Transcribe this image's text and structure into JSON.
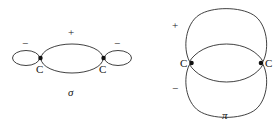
{
  "figure": {
    "background_color": "#ffffff",
    "stroke_color": "#2b2b2b",
    "atom_dot_color": "#111111"
  },
  "sigma_diagram": {
    "name_label": "σ",
    "atoms": [
      {
        "label": "C",
        "x": 40,
        "y": 58
      },
      {
        "label": "C",
        "x": 104,
        "y": 58
      }
    ],
    "lobes": [
      {
        "id": "sigma-left-small-lobe",
        "sign": "−",
        "shape": "ellipse"
      },
      {
        "id": "sigma-center-large-lobe",
        "sign": "+",
        "shape": "ellipse"
      },
      {
        "id": "sigma-right-small-lobe",
        "sign": "−",
        "shape": "ellipse"
      }
    ],
    "signs": {
      "left_minus": "−",
      "center_plus": "+",
      "right_minus": "−"
    }
  },
  "pi_diagram": {
    "name_label": "π",
    "atoms": [
      {
        "label": "C",
        "x": 186,
        "y": 63
      },
      {
        "label": "C",
        "x": 266,
        "y": 63
      }
    ],
    "lobes": [
      {
        "id": "pi-top-lobe",
        "sign": "+",
        "shape": "kidney"
      },
      {
        "id": "pi-bottom-lobe",
        "sign": "−",
        "shape": "kidney"
      }
    ],
    "signs": {
      "top_plus": "+",
      "bottom_minus": "−"
    }
  }
}
